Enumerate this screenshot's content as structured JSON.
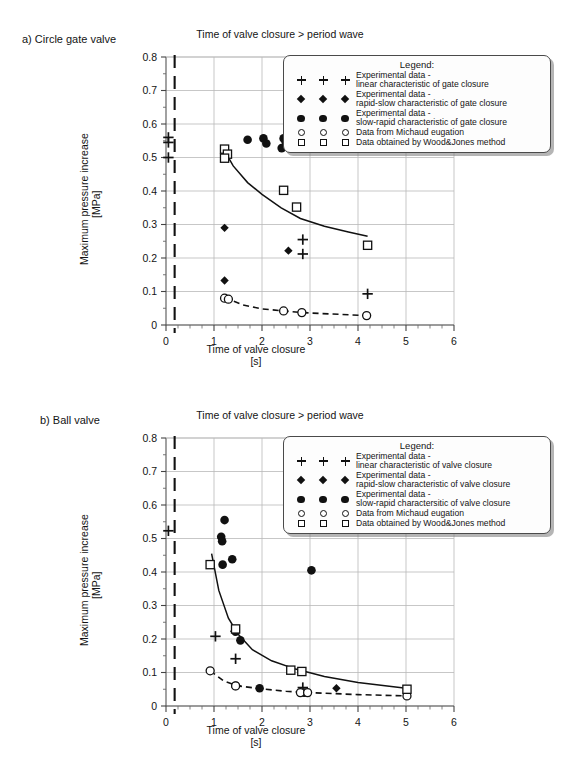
{
  "page": {
    "panels": [
      {
        "id": "a",
        "label": "a) Circle gate valve",
        "title": "Time of valve closure > period wave",
        "ylabel_line1": "Maximum pressure increase",
        "ylabel_line2": "[MPa]",
        "xlabel_line1": "Time of valve closure",
        "xlabel_line2": "[s]",
        "legend": {
          "title": "Legend:",
          "items": [
            {
              "symbol": "plus",
              "line1": "Experimental data -",
              "line2": "linear characteristic of gate closure"
            },
            {
              "symbol": "diamond",
              "line1": "Experimental data -",
              "line2": "rapid-slow characteristic of gate closure"
            },
            {
              "symbol": "circle-f",
              "line1": "Experimental data -",
              "line2": "slow-rapid characteristic of gate closure"
            },
            {
              "symbol": "circle-o",
              "line1": "Data from Michaud eugation",
              "line2": ""
            },
            {
              "symbol": "square-o",
              "line1": "Data obtained by Wood&Jones method",
              "line2": ""
            }
          ]
        }
      },
      {
        "id": "b",
        "label": "b) Ball valve",
        "title": "Time of valve closure > period wave",
        "ylabel_line1": "Maximum pressure increase",
        "ylabel_line2": "[MPa]",
        "xlabel_line1": "Time of valve closure",
        "xlabel_line2": "[s]",
        "legend": {
          "title": "Legend:",
          "items": [
            {
              "symbol": "plus",
              "line1": "Experimental data -",
              "line2": "linear characteristic of valve closure"
            },
            {
              "symbol": "diamond",
              "line1": "Experimental data -",
              "line2": "rapid-slow characteristic of valve closure"
            },
            {
              "symbol": "circle-f",
              "line1": "Experimental data -",
              "line2": "slow-rapid charactersitic of valve closure"
            },
            {
              "symbol": "circle-o",
              "line1": "Data from Michaud eugation",
              "line2": ""
            },
            {
              "symbol": "square-o",
              "line1": "Data obtained by Wood&Jones method",
              "line2": ""
            }
          ]
        }
      }
    ]
  },
  "chart_data": [
    {
      "type": "scatter",
      "panel": "a",
      "title": "Time of valve closure > period wave",
      "subtitle": "a) Circle gate valve",
      "xlabel": "Time of valve closure [s]",
      "ylabel": "Maximum pressure increase [MPa]",
      "xlim": [
        0,
        6
      ],
      "ylim": [
        0,
        0.8
      ],
      "xticks": [
        0,
        1,
        2,
        3,
        4,
        5,
        6
      ],
      "yticks": [
        0,
        0.1,
        0.2,
        0.3,
        0.4,
        0.5,
        0.6,
        0.7,
        0.8
      ],
      "xminor_step": 0.25,
      "yminor_step": 0.05,
      "grid": true,
      "legend_position": "upper-right",
      "vertical_dashed_line_x": 0.18,
      "series": [
        {
          "name": "Experimental data - linear characteristic of gate closure",
          "marker": "plus",
          "points": [
            [
              0.05,
              0.56
            ],
            [
              0.05,
              0.545
            ],
            [
              0.05,
              0.5
            ],
            [
              2.85,
              0.255
            ],
            [
              2.85,
              0.212
            ],
            [
              4.2,
              0.093
            ]
          ]
        },
        {
          "name": "Experimental data - rapid-slow characteristic of gate closure",
          "marker": "diamond",
          "points": [
            [
              1.22,
              0.29
            ],
            [
              1.22,
              0.133
            ],
            [
              2.55,
              0.222
            ]
          ]
        },
        {
          "name": "Experimental data - slow-rapid characteristic of gate closure",
          "marker": "circle-filled",
          "points": [
            [
              1.7,
              0.553
            ],
            [
              2.03,
              0.557
            ],
            [
              2.09,
              0.542
            ],
            [
              2.45,
              0.557
            ],
            [
              2.49,
              0.548
            ],
            [
              2.41,
              0.528
            ],
            [
              2.55,
              0.552
            ]
          ]
        },
        {
          "name": "Data from Michaud eugation",
          "marker": "circle-open",
          "points": [
            [
              1.22,
              0.08
            ],
            [
              1.3,
              0.077
            ],
            [
              2.45,
              0.042
            ],
            [
              2.83,
              0.037
            ],
            [
              4.18,
              0.028
            ]
          ]
        },
        {
          "name": "Data obtained by Wood&Jones method",
          "marker": "square-open",
          "points": [
            [
              1.22,
              0.525
            ],
            [
              1.28,
              0.51
            ],
            [
              1.22,
              0.498
            ],
            [
              2.45,
              0.402
            ],
            [
              2.72,
              0.352
            ],
            [
              4.2,
              0.238
            ]
          ]
        }
      ],
      "fit_curve_solid": {
        "comment": "Wood&Jones trend, decaying from ~0.53 at t=1.2 to ~0.265 at t=4.2",
        "points": [
          [
            1.2,
            0.525
          ],
          [
            1.4,
            0.475
          ],
          [
            1.7,
            0.425
          ],
          [
            2.0,
            0.39
          ],
          [
            2.4,
            0.35
          ],
          [
            2.8,
            0.318
          ],
          [
            3.3,
            0.295
          ],
          [
            3.8,
            0.278
          ],
          [
            4.2,
            0.265
          ]
        ]
      },
      "fit_curve_dashed": {
        "comment": "Michaud trend, decaying from ~0.082 at t=1.2 to ~0.028 at t=4.2",
        "points": [
          [
            1.22,
            0.082
          ],
          [
            1.6,
            0.06
          ],
          [
            2.0,
            0.048
          ],
          [
            2.45,
            0.042
          ],
          [
            2.83,
            0.037
          ],
          [
            3.4,
            0.033
          ],
          [
            4.18,
            0.028
          ]
        ]
      }
    },
    {
      "type": "scatter",
      "panel": "b",
      "title": "Time of valve closure > period wave",
      "subtitle": "b) Ball valve",
      "xlabel": "Time of valve closure [s]",
      "ylabel": "Maximum pressure increase [MPa]",
      "xlim": [
        0,
        6
      ],
      "ylim": [
        0,
        0.8
      ],
      "xticks": [
        0,
        1,
        2,
        3,
        4,
        5,
        6
      ],
      "yticks": [
        0,
        0.1,
        0.2,
        0.3,
        0.4,
        0.5,
        0.6,
        0.7,
        0.8
      ],
      "xminor_step": 0.25,
      "yminor_step": 0.05,
      "grid": true,
      "legend_position": "upper-right",
      "vertical_dashed_line_x": 0.18,
      "series": [
        {
          "name": "Experimental data - linear characteristic of valve closure",
          "marker": "plus",
          "points": [
            [
              0.05,
              0.523
            ],
            [
              1.03,
              0.208
            ],
            [
              1.45,
              0.141
            ],
            [
              2.85,
              0.055
            ]
          ]
        },
        {
          "name": "Experimental data - rapid-slow characteristic of valve closure",
          "marker": "diamond",
          "points": [
            [
              1.42,
              0.223
            ],
            [
              1.48,
              0.06
            ],
            [
              2.87,
              0.04
            ],
            [
              3.55,
              0.053
            ]
          ]
        },
        {
          "name": "Experimental data - slow-rapid charactersitic of valve closure",
          "marker": "circle-filled",
          "points": [
            [
              1.22,
              0.555
            ],
            [
              1.15,
              0.505
            ],
            [
              1.17,
              0.492
            ],
            [
              1.18,
              0.422
            ],
            [
              1.38,
              0.438
            ],
            [
              3.03,
              0.405
            ],
            [
              1.45,
              0.222
            ],
            [
              1.55,
              0.196
            ],
            [
              1.45,
              0.06
            ],
            [
              1.95,
              0.053
            ],
            [
              2.88,
              0.04
            ]
          ]
        },
        {
          "name": "Data from Michaud eugation",
          "marker": "circle-open",
          "points": [
            [
              0.92,
              0.105
            ],
            [
              1.45,
              0.06
            ],
            [
              2.8,
              0.04
            ],
            [
              2.95,
              0.04
            ],
            [
              5.02,
              0.03
            ]
          ]
        },
        {
          "name": "Data obtained by Wood&Jones method",
          "marker": "square-open",
          "points": [
            [
              0.92,
              0.422
            ],
            [
              1.45,
              0.23
            ],
            [
              2.6,
              0.107
            ],
            [
              2.83,
              0.103
            ],
            [
              5.02,
              0.05
            ]
          ]
        }
      ],
      "fit_curve_solid": {
        "comment": "Wood&Jones trend, decaying from ~0.455 at t=0.95 to ~0.053 at t=5.0",
        "points": [
          [
            0.95,
            0.455
          ],
          [
            1.1,
            0.345
          ],
          [
            1.3,
            0.262
          ],
          [
            1.5,
            0.215
          ],
          [
            1.8,
            0.168
          ],
          [
            2.2,
            0.135
          ],
          [
            2.7,
            0.11
          ],
          [
            3.3,
            0.088
          ],
          [
            4.0,
            0.07
          ],
          [
            5.0,
            0.053
          ]
        ]
      },
      "fit_curve_dashed": {
        "comment": "Michaud trend, decaying from ~0.105 at t=0.92 to ~0.030 at t=5.0",
        "points": [
          [
            0.92,
            0.105
          ],
          [
            1.2,
            0.075
          ],
          [
            1.5,
            0.06
          ],
          [
            1.95,
            0.052
          ],
          [
            2.5,
            0.044
          ],
          [
            3.0,
            0.04
          ],
          [
            4.0,
            0.034
          ],
          [
            5.02,
            0.03
          ]
        ]
      }
    }
  ]
}
